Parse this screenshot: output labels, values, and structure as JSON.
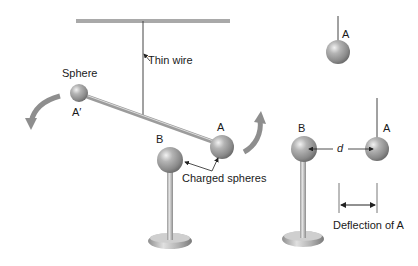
{
  "diagram": {
    "left_panel": {
      "labels": {
        "thin_wire": "Thin wire",
        "sphere": "Sphere",
        "a_prime": "A′",
        "a": "A",
        "b": "B",
        "charged_spheres": "Charged spheres"
      }
    },
    "top_right_panel": {
      "labels": {
        "a": "A"
      }
    },
    "bottom_right_panel": {
      "labels": {
        "b": "B",
        "a": "A",
        "d": "d",
        "deflection": "Deflection of A"
      }
    },
    "colors": {
      "sphere": "#9a9a9a",
      "sphere_highlight": "#e8e8e8",
      "rod": "#b8b8b8",
      "arrow": "#8a8a8a",
      "ceiling": "#a8a8a8",
      "line": "#333333"
    }
  }
}
